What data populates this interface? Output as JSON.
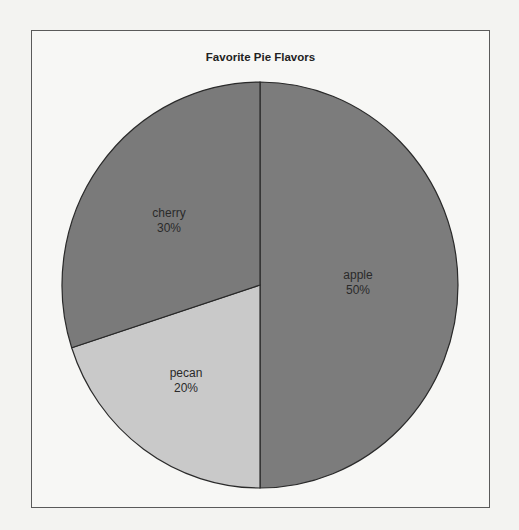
{
  "chart_data": {
    "type": "pie",
    "title": "Favorite Pie Flavors",
    "categories": [
      "apple",
      "pecan",
      "cherry"
    ],
    "values": [
      50,
      20,
      30
    ],
    "labels": [
      "50%",
      "20%",
      "30%"
    ],
    "colors": [
      "#7c7c7c",
      "#c9c9c9",
      "#7a7a7a"
    ],
    "start_angle_deg": 0,
    "direction": "clockwise",
    "legend": "none",
    "xlabel": "",
    "ylabel": ""
  },
  "slices": [
    {
      "name": "apple",
      "pct": "50%",
      "color": "#7c7c7c",
      "label_x": 358,
      "label_y": 283
    },
    {
      "name": "pecan",
      "pct": "20%",
      "color": "#c9c9c9",
      "label_x": 186,
      "label_y": 381
    },
    {
      "name": "cherry",
      "pct": "30%",
      "color": "#7a7a7a",
      "label_x": 169,
      "label_y": 221
    }
  ]
}
